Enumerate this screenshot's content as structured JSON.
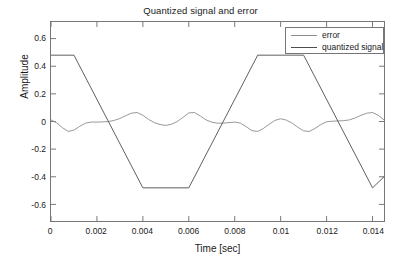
{
  "chart_data": {
    "type": "line",
    "title": "Quantized signal and error",
    "xlabel": "Time [sec]",
    "ylabel": "Amplitude",
    "xlim": [
      0,
      0.0145
    ],
    "ylim": [
      -0.72,
      0.72
    ],
    "grid": false,
    "legend_position": "top-right",
    "xticks": [
      0,
      0.002,
      0.004,
      0.006,
      0.008,
      0.01,
      0.012,
      0.014
    ],
    "xtick_labels": [
      "0",
      "0.002",
      "0.004",
      "0.006",
      "0.008",
      "0.01",
      "0.012",
      "0.014"
    ],
    "yticks": [
      0.6,
      0.4,
      0.2,
      0,
      -0.2,
      -0.4,
      -0.6
    ],
    "ytick_labels": [
      "0.6",
      "0.4",
      "0.2",
      "0",
      "-0.2",
      "-0.4",
      "-0.6"
    ],
    "series": [
      {
        "name": "error",
        "color": "#8c8c8c",
        "x": [
          0.0,
          0.00025,
          0.0005,
          0.00075,
          0.001,
          0.00125,
          0.0015,
          0.00175,
          0.002,
          0.00225,
          0.0025,
          0.00275,
          0.003,
          0.00325,
          0.0035,
          0.00375,
          0.004,
          0.00425,
          0.0045,
          0.00475,
          0.005,
          0.00525,
          0.0055,
          0.00575,
          0.006,
          0.00625,
          0.0065,
          0.00675,
          0.007,
          0.00725,
          0.0075,
          0.00775,
          0.008,
          0.00825,
          0.0085,
          0.00875,
          0.009,
          0.00925,
          0.0095,
          0.00975,
          0.01,
          0.01025,
          0.0105,
          0.01075,
          0.011,
          0.01125,
          0.0115,
          0.01175,
          0.012,
          0.01225,
          0.0125,
          0.01275,
          0.013,
          0.01325,
          0.0135,
          0.01375,
          0.014,
          0.01425,
          0.0145
        ],
        "y": [
          0.012,
          -0.01,
          -0.045,
          -0.072,
          -0.062,
          -0.035,
          -0.012,
          -0.004,
          -0.004,
          -0.003,
          0.0,
          0.008,
          0.022,
          0.042,
          0.06,
          0.065,
          0.045,
          0.015,
          -0.008,
          -0.022,
          -0.028,
          -0.02,
          0.0,
          0.03,
          0.062,
          0.065,
          0.04,
          0.012,
          -0.005,
          -0.012,
          -0.012,
          -0.008,
          -0.004,
          -0.012,
          -0.038,
          -0.066,
          -0.072,
          -0.05,
          -0.02,
          0.008,
          0.02,
          0.01,
          -0.012,
          -0.042,
          -0.068,
          -0.072,
          -0.05,
          -0.022,
          -0.002,
          0.002,
          0.004,
          0.006,
          0.012,
          0.026,
          0.045,
          0.06,
          0.065,
          0.045,
          0.012
        ]
      },
      {
        "name": "quantized signal",
        "color": "#4d4d4d",
        "x": [
          0.0,
          0.001,
          0.004,
          0.006,
          0.009,
          0.011,
          0.014,
          0.0145
        ],
        "y": [
          0.48,
          0.48,
          -0.48,
          -0.48,
          0.48,
          0.48,
          -0.48,
          -0.4
        ]
      }
    ]
  },
  "legend": {
    "entries": [
      {
        "label": "error"
      },
      {
        "label": "quantized signal"
      }
    ]
  }
}
